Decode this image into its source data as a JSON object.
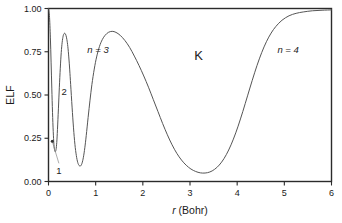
{
  "chart_data": {
    "type": "line",
    "title": "",
    "xlabel_italic": "r",
    "xlabel_rest": " (Bohr)",
    "xlabel": "r (Bohr)",
    "ylabel": "ELF",
    "xlim": [
      0,
      6
    ],
    "ylim": [
      0,
      1.0
    ],
    "grid": false,
    "legend": "none",
    "xticks": [
      0,
      1,
      2,
      3,
      4,
      5,
      6
    ],
    "xtick_labels": [
      "0",
      "1",
      "2",
      "3",
      "4",
      "5",
      "6"
    ],
    "yticks": [
      0.0,
      0.25,
      0.5,
      0.75,
      1.0
    ],
    "ytick_labels": [
      "0.00",
      "0.25",
      "0.50",
      "0.75",
      "1.00"
    ],
    "series": [
      {
        "name": "ELF",
        "color": "#555555",
        "x": [
          0.0,
          0.02,
          0.04,
          0.055,
          0.07,
          0.085,
          0.1,
          0.115,
          0.13,
          0.145,
          0.16,
          0.175,
          0.19,
          0.21,
          0.23,
          0.25,
          0.27,
          0.29,
          0.31,
          0.33,
          0.35,
          0.37,
          0.39,
          0.41,
          0.43,
          0.45,
          0.47,
          0.5,
          0.53,
          0.56,
          0.59,
          0.62,
          0.65,
          0.68,
          0.71,
          0.74,
          0.77,
          0.8,
          0.84,
          0.88,
          0.92,
          0.97,
          1.02,
          1.08,
          1.14,
          1.2,
          1.27,
          1.35,
          1.43,
          1.52,
          1.62,
          1.72,
          1.82,
          1.92,
          2.02,
          2.12,
          2.22,
          2.32,
          2.42,
          2.52,
          2.62,
          2.72,
          2.82,
          2.92,
          3.02,
          3.12,
          3.22,
          3.32,
          3.42,
          3.52,
          3.62,
          3.72,
          3.82,
          3.92,
          4.02,
          4.12,
          4.22,
          4.32,
          4.42,
          4.52,
          4.62,
          4.72,
          4.82,
          4.95,
          5.1,
          5.25,
          5.4,
          5.6,
          5.8,
          6.0
        ],
        "y": [
          1.0,
          0.96,
          0.83,
          0.69,
          0.54,
          0.4,
          0.29,
          0.215,
          0.18,
          0.172,
          0.185,
          0.225,
          0.3,
          0.42,
          0.545,
          0.655,
          0.745,
          0.805,
          0.84,
          0.855,
          0.856,
          0.845,
          0.82,
          0.78,
          0.72,
          0.645,
          0.56,
          0.43,
          0.31,
          0.215,
          0.15,
          0.11,
          0.092,
          0.09,
          0.105,
          0.14,
          0.195,
          0.265,
          0.37,
          0.47,
          0.56,
          0.65,
          0.72,
          0.78,
          0.82,
          0.845,
          0.862,
          0.868,
          0.862,
          0.845,
          0.815,
          0.775,
          0.725,
          0.67,
          0.61,
          0.545,
          0.475,
          0.405,
          0.335,
          0.27,
          0.212,
          0.163,
          0.124,
          0.094,
          0.072,
          0.058,
          0.05,
          0.049,
          0.055,
          0.07,
          0.095,
          0.132,
          0.182,
          0.245,
          0.32,
          0.405,
          0.495,
          0.585,
          0.67,
          0.745,
          0.808,
          0.858,
          0.896,
          0.932,
          0.958,
          0.972,
          0.98,
          0.987,
          0.99,
          0.992
        ]
      }
    ],
    "annotations": [
      {
        "id": "shell-1",
        "text": "1",
        "x": 0.22,
        "y": 0.045,
        "leader_from_x": 0.22,
        "leader_from_y": 0.105,
        "leader_to_x": 0.08,
        "leader_to_y": 0.232,
        "italic": false
      },
      {
        "id": "shell-2",
        "text": "2",
        "x": 0.33,
        "y": 0.5,
        "italic": false
      },
      {
        "id": "shell-3",
        "text": "n = 3",
        "x": 1.05,
        "y": 0.74,
        "italic": true
      },
      {
        "id": "shell-K",
        "text": "K",
        "x": 3.18,
        "y": 0.7,
        "italic": false,
        "big": true
      },
      {
        "id": "shell-4",
        "text": "n = 4",
        "x": 5.08,
        "y": 0.74,
        "italic": true
      }
    ]
  },
  "figure": {
    "background": "#ffffff",
    "frame_color": "#2b2b2b",
    "curve_color": "#555555"
  }
}
